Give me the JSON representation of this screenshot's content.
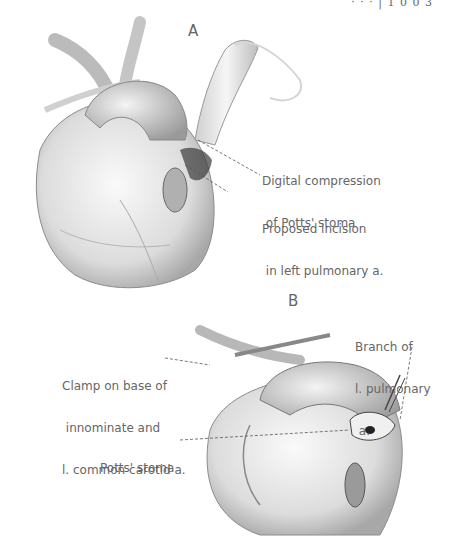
{
  "header": {
    "text": "· · ·  |  1 0 0 3"
  },
  "figure": {
    "panel_a": {
      "letter": "A",
      "labels": [
        {
          "id": "digital-compression",
          "lines": [
            "Digital compression",
            " of Potts' stoma"
          ]
        },
        {
          "id": "proposed-incision",
          "lines": [
            "Proposed incision",
            " in left pulmonary a."
          ]
        }
      ]
    },
    "panel_b": {
      "letter": "B",
      "labels": [
        {
          "id": "branch-lpa",
          "lines": [
            "Branch of",
            "l. pulmonary",
            " a."
          ]
        },
        {
          "id": "clamp",
          "lines": [
            "Clamp on base of",
            " innominate and",
            "l. common carotid a."
          ]
        },
        {
          "id": "potts-stoma",
          "lines": [
            "Potts' stoma"
          ]
        }
      ]
    }
  }
}
